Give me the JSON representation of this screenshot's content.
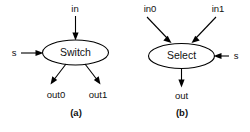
{
  "figure": {
    "background_color": "#ffffff",
    "line_color": "#000000",
    "text_color": "#111111",
    "panels": [
      {
        "caption": "(a)",
        "node": {
          "label": "Switch",
          "shape": "ellipse"
        },
        "inputs": [
          {
            "name": "in",
            "label": "in",
            "side": "top"
          },
          {
            "name": "s",
            "label": "s",
            "side": "left"
          }
        ],
        "outputs": [
          {
            "name": "out0",
            "label": "out0",
            "side": "bottom-left"
          },
          {
            "name": "out1",
            "label": "out1",
            "side": "bottom-right"
          }
        ]
      },
      {
        "caption": "(b)",
        "node": {
          "label": "Select",
          "shape": "ellipse"
        },
        "inputs": [
          {
            "name": "in0",
            "label": "in0",
            "side": "top-left"
          },
          {
            "name": "in1",
            "label": "in1",
            "side": "top-right"
          },
          {
            "name": "s",
            "label": "s",
            "side": "right"
          }
        ],
        "outputs": [
          {
            "name": "out",
            "label": "out",
            "side": "bottom"
          }
        ]
      }
    ]
  }
}
